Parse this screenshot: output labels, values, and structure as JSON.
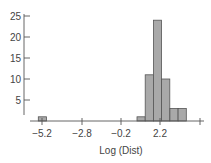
{
  "chart_data": {
    "type": "bar",
    "subtype": "histogram",
    "title": "",
    "xlabel": "Log (Dist)",
    "ylabel": "",
    "x_ticks": [
      -5.2,
      -2.8,
      -0.2,
      2.2,
      4.6
    ],
    "x_tick_labels": [
      "−5.2",
      "−2.8",
      "−0.2",
      "2.2",
      ""
    ],
    "y_ticks": [
      5,
      10,
      15,
      20,
      25
    ],
    "y_tick_labels": [
      "5",
      "10",
      "15",
      "20",
      "25"
    ],
    "ylim": [
      0,
      26
    ],
    "grid": false,
    "legend": null,
    "bin_width": 0.5,
    "bins": [
      {
        "start": -5.2,
        "end": -4.7,
        "count": 1
      },
      {
        "start": 0.8,
        "end": 1.3,
        "count": 1
      },
      {
        "start": 1.3,
        "end": 1.8,
        "count": 11
      },
      {
        "start": 1.8,
        "end": 2.3,
        "count": 24
      },
      {
        "start": 2.3,
        "end": 2.8,
        "count": 10
      },
      {
        "start": 2.8,
        "end": 3.3,
        "count": 3
      },
      {
        "start": 3.3,
        "end": 3.8,
        "count": 3
      }
    ],
    "colors": {
      "bar_fill": "#a9a9a9",
      "bar_stroke": "#555555",
      "axis": "#555555"
    }
  }
}
